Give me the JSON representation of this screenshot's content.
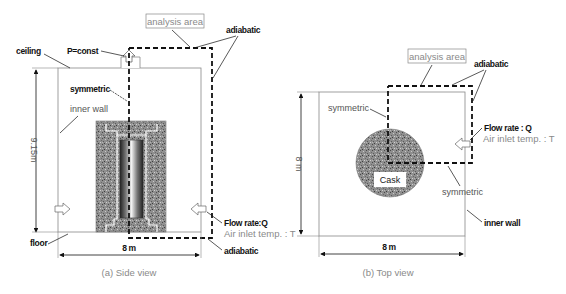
{
  "side_view": {
    "caption": "(a) Side view",
    "labels": {
      "analysis_area": "analysis area",
      "adiabatic_top": "adiabatic",
      "adiabatic_bottom": "adiabatic",
      "ceiling": "ceiling",
      "p_const": "P=const",
      "symmetric": "symmetric",
      "inner_wall": "inner wall",
      "floor": "floor",
      "height": "9.15m",
      "width": "8 m",
      "flow_rate": "Flow rate:Q",
      "air_inlet": "Air inlet temp. : T"
    }
  },
  "top_view": {
    "caption": "(b) Top view",
    "labels": {
      "analysis_area": "analysis area",
      "adiabatic": "adiabatic",
      "symmetric_top": "symmetric",
      "symmetric_bottom": "symmetric",
      "cask": "Cask",
      "inner_wall": "inner wall",
      "height": "8 m",
      "width": "8 m",
      "flow_rate": "Flow rate : Q",
      "air_inlet": "Air inlet temp. : T"
    }
  },
  "colors": {
    "line": "#111111",
    "wall": "#888888",
    "concrete": "#8a8a8a",
    "gray_text": "#8a8a8a"
  }
}
